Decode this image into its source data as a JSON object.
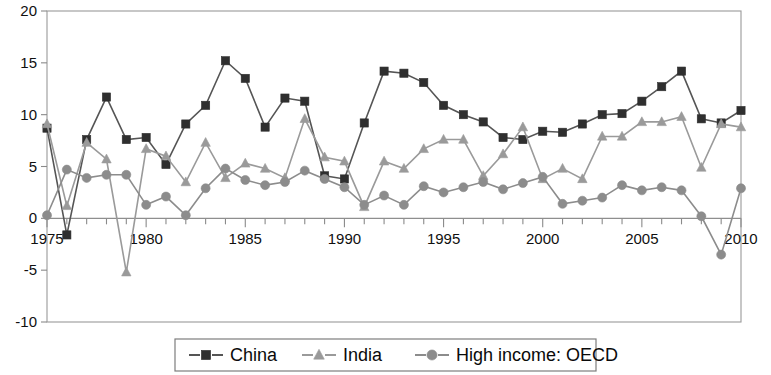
{
  "chart_data": {
    "type": "line",
    "title": "",
    "subtitle": "",
    "xlabel": "",
    "ylabel": "",
    "xlim": [
      1975,
      2010
    ],
    "ylim": [
      -10,
      20
    ],
    "grid": false,
    "legend_position": "bottom",
    "y_ticks": [
      20,
      15,
      10,
      5,
      0,
      -5,
      -10
    ],
    "y_tick_labels": [
      "20",
      "15",
      "10",
      "5",
      "0",
      "-5",
      "-10"
    ],
    "x_ticks": [
      1975,
      1980,
      1985,
      1990,
      1995,
      2000,
      2005,
      2010
    ],
    "x_tick_labels": [
      "1975",
      "1980",
      "1985",
      "1990",
      "1995",
      "2000",
      "2005",
      "2010"
    ],
    "x_minor_tick_step": 1,
    "x": [
      1975,
      1976,
      1977,
      1978,
      1979,
      1980,
      1981,
      1982,
      1983,
      1984,
      1985,
      1986,
      1987,
      1988,
      1989,
      1990,
      1991,
      1992,
      1993,
      1994,
      1995,
      1996,
      1997,
      1998,
      1999,
      2000,
      2001,
      2002,
      2003,
      2004,
      2005,
      2006,
      2007,
      2008,
      2009,
      2010
    ],
    "series": [
      {
        "name": "China",
        "marker": "square",
        "color": "#2f2f2f",
        "line_color": "#555555",
        "values": [
          8.7,
          -1.6,
          7.6,
          11.7,
          7.6,
          7.8,
          5.2,
          9.1,
          10.9,
          15.2,
          13.5,
          8.8,
          11.6,
          11.3,
          4.1,
          3.8,
          9.2,
          14.2,
          14.0,
          13.1,
          10.9,
          10.0,
          9.3,
          7.8,
          7.6,
          8.4,
          8.3,
          9.1,
          10.0,
          10.1,
          11.3,
          12.7,
          14.2,
          9.6,
          9.2,
          10.4
        ]
      },
      {
        "name": "India",
        "marker": "triangle",
        "color": "#9a9a9a",
        "line_color": "#9a9a9a",
        "values": [
          9.1,
          1.2,
          7.3,
          5.7,
          -5.2,
          6.7,
          6.0,
          3.5,
          7.3,
          3.9,
          5.3,
          4.8,
          3.9,
          9.6,
          5.9,
          5.5,
          1.1,
          5.5,
          4.8,
          6.7,
          7.6,
          7.6,
          4.1,
          6.2,
          8.8,
          3.8,
          4.8,
          3.8,
          7.9,
          7.9,
          9.3,
          9.3,
          9.8,
          4.9,
          9.1,
          8.8
        ]
      },
      {
        "name": "High income: OECD",
        "marker": "circle",
        "color": "#8c8c8c",
        "line_color": "#8c8c8c",
        "values": [
          0.3,
          4.7,
          3.9,
          4.2,
          4.2,
          1.3,
          2.1,
          0.3,
          2.9,
          4.8,
          3.7,
          3.2,
          3.5,
          4.6,
          3.8,
          3.0,
          1.3,
          2.2,
          1.3,
          3.1,
          2.5,
          3.0,
          3.5,
          2.8,
          3.4,
          4.0,
          1.4,
          1.7,
          2.0,
          3.2,
          2.7,
          3.0,
          2.7,
          0.2,
          -3.5,
          2.9
        ]
      }
    ]
  },
  "legend": {
    "entries": [
      {
        "label": "China",
        "marker": "square-icon"
      },
      {
        "label": "India",
        "marker": "triangle-icon"
      },
      {
        "label": "High income: OECD",
        "marker": "circle-icon"
      }
    ]
  },
  "colors": {
    "china": "#2f2f2f",
    "india": "#9a9a9a",
    "oecd": "#8c8c8c",
    "axis": "#8a8a8a",
    "background": "#ffffff"
  }
}
